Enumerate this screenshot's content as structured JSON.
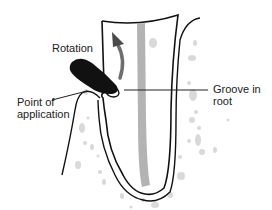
{
  "figure": {
    "labels": {
      "rotation": "Rotation",
      "point_line1": "Point of",
      "point_line2": "application",
      "groove_line1": "Groove in",
      "groove_line2": "root"
    },
    "colors": {
      "outline": "#111111",
      "instrument": "#111111",
      "root_canal": "#b3b3b3",
      "arrow": "#6e6e6e",
      "bone_speckle": "#d6d6d6",
      "text": "#222222"
    }
  }
}
